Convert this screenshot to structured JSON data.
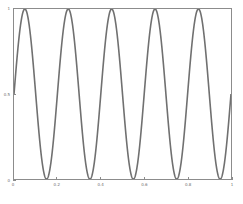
{
  "chart_data": {
    "type": "line",
    "title": "",
    "subtitle": "",
    "xlabel": "",
    "ylabel": "",
    "xlim": [
      0,
      1
    ],
    "ylim": [
      0,
      1
    ],
    "grid": false,
    "legend": null,
    "annotations": [],
    "series": [
      {
        "name": "sine wave",
        "color": "#707070",
        "linewidth": 0.7,
        "description": "y = 0.5 + 0.5*sin(2*pi*5*x), 5 full cycles across x from 0 to 1",
        "amplitude": 0.5,
        "offset": 0.5,
        "cycles": 5,
        "phase": 0,
        "x": [
          0,
          0.05,
          0.1,
          0.15,
          0.2,
          0.25,
          0.3,
          0.35,
          0.4,
          0.45,
          0.5,
          0.55,
          0.6,
          0.65,
          0.7,
          0.75,
          0.8,
          0.85,
          0.9,
          0.95,
          1
        ],
        "values": [
          0.5,
          1,
          0.5,
          0,
          0.5,
          1,
          0.5,
          0,
          0.5,
          1,
          0.5,
          0,
          0.5,
          1,
          0.5,
          0,
          0.5,
          1,
          0.5,
          0,
          0.5
        ],
        "peaks_x": [
          0.05,
          0.25,
          0.45,
          0.65,
          0.85
        ],
        "peaks_y": [
          1,
          1,
          1,
          1,
          1
        ],
        "troughs_x": [
          0.15,
          0.35,
          0.55,
          0.75,
          0.95
        ],
        "troughs_y": [
          0,
          0,
          0,
          0,
          0
        ]
      }
    ],
    "xticks": [
      {
        "value": 0,
        "label": "0",
        "pos": 0
      },
      {
        "value": 0.2,
        "label": "0.2",
        "pos": 0.2
      },
      {
        "value": 0.4,
        "label": "0.4",
        "pos": 0.4
      },
      {
        "value": 0.6,
        "label": "0.6",
        "pos": 0.6
      },
      {
        "value": 0.8,
        "label": "0.8",
        "pos": 0.8
      },
      {
        "value": 1,
        "label": "1",
        "pos": 1
      }
    ],
    "yticks": [
      {
        "value": 0,
        "label": "0",
        "pos": 0
      },
      {
        "value": 0.5,
        "label": "0.5",
        "pos": 0.5
      },
      {
        "value": 1,
        "label": "1",
        "pos": 1
      }
    ]
  },
  "figure": {
    "background_color": "#ffffff",
    "axes_color": "#8c8c8c",
    "tick_label_color": "#6e6e6e",
    "line_color": "#707070"
  }
}
